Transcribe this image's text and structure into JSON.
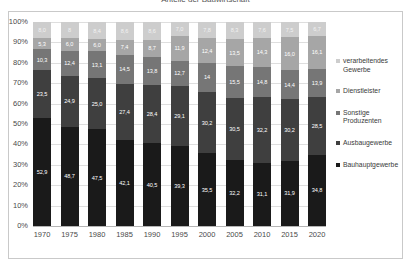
{
  "chart_data": {
    "type": "bar",
    "stacked": true,
    "normalized": "100%",
    "title": "Anteile der Bauwirtschaft",
    "xlabel": "",
    "ylabel": "",
    "ylim": [
      0,
      100
    ],
    "grid": true,
    "legend_position": "right",
    "categories": [
      "1970",
      "1975",
      "1980",
      "1985",
      "1990",
      "1995",
      "2000",
      "2005",
      "2010",
      "2015",
      "2020"
    ],
    "ytick_labels": [
      "0%",
      "10%",
      "20%",
      "30%",
      "40%",
      "50%",
      "60%",
      "70%",
      "80%",
      "90%",
      "100%"
    ],
    "ytick_values": [
      0,
      10,
      20,
      30,
      40,
      50,
      60,
      70,
      80,
      90,
      100
    ],
    "series": [
      {
        "name": "Bauhauptgewerbe",
        "color": "#1a1a1a",
        "label_color": "#ffffff",
        "values": [
          52.9,
          48.7,
          47.5,
          42.1,
          40.5,
          39.3,
          35.5,
          32.2,
          31.1,
          31.9,
          34.8
        ],
        "labels": [
          "52,9",
          "48,7",
          "47,5",
          "42,1",
          "40,5",
          "39,3",
          "35,5",
          "32,2",
          "31,1",
          "31,9",
          "34,8"
        ]
      },
      {
        "name": "Ausbaugewerbe",
        "color": "#3f3f3f",
        "label_color": "#ffffff",
        "values": [
          23.5,
          24.9,
          25.0,
          27.4,
          28.4,
          29.1,
          30.2,
          30.5,
          32.2,
          30.2,
          28.5
        ],
        "labels": [
          "23,5",
          "24,9",
          "25,0",
          "27,4",
          "28,4",
          "29,1",
          "30,2",
          "30,5",
          "32,2",
          "30,2",
          "28,5"
        ]
      },
      {
        "name": "Sonstige Produzenten",
        "color": "#767676",
        "label_color": "#ffffff",
        "values": [
          10.3,
          12.4,
          13.1,
          14.5,
          13.8,
          12.7,
          14.0,
          15.5,
          14.8,
          14.4,
          13.9
        ],
        "labels": [
          "10,3",
          "12,4",
          "13,1",
          "14,5",
          "13,8",
          "12,7",
          "14",
          "15,5",
          "14,8",
          "14,4",
          "13,9"
        ]
      },
      {
        "name": "Dienstleister",
        "color": "#a6a6a6",
        "label_color": "#ffffff",
        "values": [
          5.3,
          6.0,
          6.0,
          7.4,
          8.7,
          11.9,
          12.4,
          13.5,
          14.3,
          16.0,
          16.1
        ],
        "labels": [
          "5,3",
          "6,0",
          "6,0",
          "7,4",
          "8,7",
          "11,9",
          "12,4",
          "13,5",
          "14,3",
          "16,0",
          "16,1"
        ]
      },
      {
        "name": "verarbeitendes Gewerbe",
        "color": "#cdcdcd",
        "label_color": "#f2f2f2",
        "values": [
          8.0,
          8.0,
          8.4,
          8.6,
          8.6,
          7.0,
          7.8,
          8.3,
          7.6,
          7.5,
          6.7
        ],
        "labels": [
          "8,0",
          "8",
          "8,4",
          "8,6",
          "8,6",
          "7,0",
          "7,8",
          "8,3",
          "7,6",
          "7,5",
          "6,7"
        ]
      }
    ]
  },
  "legend": {
    "items": [
      {
        "label": "verarbeitendes Gewerbe",
        "color": "#cdcdcd"
      },
      {
        "label": "Dienstleister",
        "color": "#a6a6a6"
      },
      {
        "label": "Sonstige Produzenten",
        "color": "#767676"
      },
      {
        "label": "Ausbaugewerbe",
        "color": "#3f3f3f"
      },
      {
        "label": "Bauhauptgewerbe",
        "color": "#1a1a1a"
      }
    ]
  }
}
